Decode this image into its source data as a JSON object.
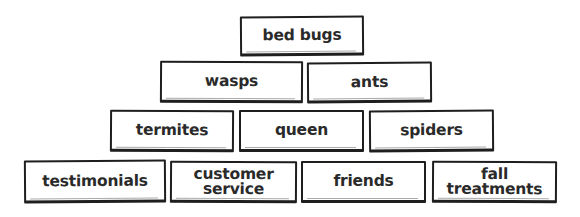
{
  "diagram": {
    "type": "pyramid",
    "rows": [
      {
        "level": 1,
        "items": [
          {
            "label": "bed bugs",
            "x": 240,
            "y": 16,
            "w": 124,
            "h": 40
          }
        ]
      },
      {
        "level": 2,
        "items": [
          {
            "label": "wasps",
            "x": 160,
            "y": 61,
            "w": 143,
            "h": 42
          },
          {
            "label": "ants",
            "x": 307,
            "y": 62,
            "w": 125,
            "h": 41
          }
        ]
      },
      {
        "level": 3,
        "items": [
          {
            "label": "termites",
            "x": 110,
            "y": 110,
            "w": 124,
            "h": 42
          },
          {
            "label": "queen",
            "x": 239,
            "y": 110,
            "w": 125,
            "h": 42
          },
          {
            "label": "spiders",
            "x": 369,
            "y": 110,
            "w": 125,
            "h": 42
          }
        ]
      },
      {
        "level": 4,
        "items": [
          {
            "label": "testimonials",
            "x": 24,
            "y": 160,
            "w": 142,
            "h": 43
          },
          {
            "label": "customer service",
            "line1": "customer",
            "line2": "service",
            "x": 170,
            "y": 161,
            "w": 127,
            "h": 42
          },
          {
            "label": "friends",
            "x": 301,
            "y": 161,
            "w": 125,
            "h": 42
          },
          {
            "label": "fall treatments",
            "line1": "fall",
            "line2": "treatments",
            "x": 432,
            "y": 161,
            "w": 125,
            "h": 42
          }
        ]
      }
    ],
    "colors": {
      "border": "#1e1e1e",
      "text": "#2a2a2a",
      "background": "#ffffff"
    }
  }
}
